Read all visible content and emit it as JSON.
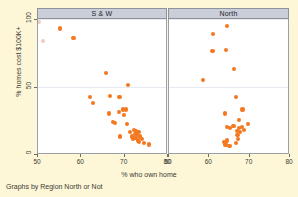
{
  "chart_data": {
    "type": "scatter",
    "title": "",
    "xlabel": "% who own home",
    "ylabel": "% homes cost $100K+",
    "caption": "Graphs by Region North or Not",
    "xlim": [
      50,
      80
    ],
    "ylim": [
      0,
      100
    ],
    "xticks": [
      50,
      60,
      70,
      80
    ],
    "yticks": [
      0,
      50,
      100
    ],
    "grid": true,
    "grid_axis": "y",
    "legend": "none",
    "marker_color": "#f4781f",
    "panel_header_color": "#c9ced8",
    "background_color": "#fdf7d8",
    "plot_background_color": "#ffffff",
    "panels": [
      {
        "label": "S & W",
        "points": [
          {
            "x": 50.3,
            "y": 98.0,
            "faint": true
          },
          {
            "x": 51.2,
            "y": 84.0,
            "faint": true
          },
          {
            "x": 55.0,
            "y": 93.0
          },
          {
            "x": 58.2,
            "y": 86.0
          },
          {
            "x": 65.6,
            "y": 60.0
          },
          {
            "x": 70.8,
            "y": 51.0
          },
          {
            "x": 62.0,
            "y": 42.0
          },
          {
            "x": 62.6,
            "y": 38.0
          },
          {
            "x": 66.6,
            "y": 43.0
          },
          {
            "x": 68.8,
            "y": 42.0
          },
          {
            "x": 66.3,
            "y": 30.0
          },
          {
            "x": 67.4,
            "y": 24.0
          },
          {
            "x": 67.8,
            "y": 23.0
          },
          {
            "x": 68.6,
            "y": 31.0
          },
          {
            "x": 69.6,
            "y": 33.0
          },
          {
            "x": 69.8,
            "y": 29.0
          },
          {
            "x": 70.4,
            "y": 33.0
          },
          {
            "x": 69.0,
            "y": 13.0
          },
          {
            "x": 70.6,
            "y": 22.0
          },
          {
            "x": 71.2,
            "y": 16.0
          },
          {
            "x": 71.6,
            "y": 13.0
          },
          {
            "x": 71.9,
            "y": 11.0
          },
          {
            "x": 72.1,
            "y": 18.0
          },
          {
            "x": 72.3,
            "y": 15.0
          },
          {
            "x": 72.5,
            "y": 12.0
          },
          {
            "x": 72.6,
            "y": 17.0
          },
          {
            "x": 72.8,
            "y": 14.0
          },
          {
            "x": 73.0,
            "y": 10.0
          },
          {
            "x": 73.2,
            "y": 16.0
          },
          {
            "x": 73.4,
            "y": 9.0
          },
          {
            "x": 73.6,
            "y": 13.0
          },
          {
            "x": 74.0,
            "y": 11.0
          },
          {
            "x": 74.4,
            "y": 8.0
          },
          {
            "x": 75.6,
            "y": 7.0
          }
        ]
      },
      {
        "label": "North",
        "points": [
          {
            "x": 61.0,
            "y": 89.0
          },
          {
            "x": 64.4,
            "y": 95.0
          },
          {
            "x": 60.8,
            "y": 76.0
          },
          {
            "x": 64.2,
            "y": 77.0
          },
          {
            "x": 66.2,
            "y": 63.0
          },
          {
            "x": 58.4,
            "y": 55.0
          },
          {
            "x": 66.6,
            "y": 42.0
          },
          {
            "x": 63.8,
            "y": 30.0
          },
          {
            "x": 68.2,
            "y": 33.0
          },
          {
            "x": 67.3,
            "y": 25.0
          },
          {
            "x": 64.4,
            "y": 20.0
          },
          {
            "x": 65.2,
            "y": 19.0
          },
          {
            "x": 66.0,
            "y": 21.0
          },
          {
            "x": 66.8,
            "y": 17.0
          },
          {
            "x": 67.0,
            "y": 14.0
          },
          {
            "x": 67.4,
            "y": 19.0
          },
          {
            "x": 67.6,
            "y": 16.0
          },
          {
            "x": 68.0,
            "y": 20.0
          },
          {
            "x": 68.6,
            "y": 18.0
          },
          {
            "x": 69.6,
            "y": 22.0
          },
          {
            "x": 63.6,
            "y": 9.0
          },
          {
            "x": 64.0,
            "y": 7.0
          },
          {
            "x": 64.4,
            "y": 10.0
          },
          {
            "x": 65.0,
            "y": 6.0
          },
          {
            "x": 66.6,
            "y": 8.0
          },
          {
            "x": 67.2,
            "y": 11.0
          }
        ]
      }
    ]
  }
}
